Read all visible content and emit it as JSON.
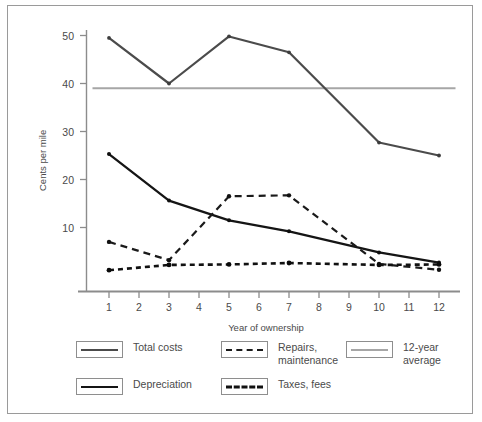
{
  "chart_data": {
    "type": "line",
    "title": "",
    "xlabel": "Year of ownership",
    "ylabel": "Cents per mile",
    "x": [
      1,
      2,
      3,
      4,
      5,
      6,
      7,
      8,
      9,
      10,
      11,
      12
    ],
    "xtick_labels": [
      "1",
      "2",
      "3",
      "4",
      "5",
      "6",
      "7",
      "8",
      "9",
      "10",
      "11",
      "12"
    ],
    "ytick_labels": [
      "10",
      "20",
      "30",
      "40",
      "50"
    ],
    "yticks": [
      10,
      20,
      30,
      40,
      50
    ],
    "xlim": [
      0.45,
      12.55
    ],
    "ylim": [
      0,
      53
    ],
    "grid": false,
    "legend_position": "below",
    "series": [
      {
        "name": "Total costs",
        "style": "solid",
        "color": "#4b4b4b",
        "x": [
          1,
          3,
          5,
          7,
          10,
          12
        ],
        "values": [
          49.5,
          40.0,
          49.8,
          46.5,
          27.7,
          25.0
        ]
      },
      {
        "name": "Depreciation",
        "style": "solid",
        "color": "#151515",
        "x": [
          1,
          3,
          5,
          7,
          10,
          12
        ],
        "values": [
          25.3,
          15.6,
          11.5,
          9.2,
          4.8,
          2.7
        ]
      },
      {
        "name": "Repairs, maintenance",
        "style": "dashed-long",
        "color": "#1a1a1a",
        "x": [
          1,
          3,
          5,
          7,
          10,
          12
        ],
        "values": [
          7.0,
          3.2,
          16.5,
          16.7,
          2.4,
          1.2
        ]
      },
      {
        "name": "Taxes, fees",
        "style": "dashed-short",
        "color": "#111111",
        "x": [
          1,
          3,
          5,
          7,
          10,
          12
        ],
        "values": [
          1.1,
          2.2,
          2.3,
          2.6,
          2.2,
          2.3
        ]
      },
      {
        "name": "12-year average",
        "style": "solid-reference",
        "color": "#a6a6a6",
        "x": [
          0.45,
          12.55
        ],
        "values": [
          39.0,
          39.0
        ]
      }
    ]
  },
  "axes": {
    "y_title": "Cents per mile",
    "x_title": "Year of ownership",
    "y_ticks": [
      "50",
      "40",
      "30",
      "20",
      "10"
    ],
    "x_ticks": [
      "1",
      "2",
      "3",
      "4",
      "5",
      "6",
      "7",
      "8",
      "9",
      "10",
      "11",
      "12"
    ]
  },
  "legend": {
    "entries": [
      {
        "label": "Total costs",
        "swatch": "solid-dark-line-swatch"
      },
      {
        "label": "Repairs,\nmaintenance",
        "swatch": "long-dashed-line-swatch"
      },
      {
        "label": "12-year average",
        "swatch": "solid-light-line-swatch"
      },
      {
        "label": "Depreciation",
        "swatch": "solid-black-line-swatch"
      },
      {
        "label": "Taxes, fees",
        "swatch": "short-dashed-line-swatch"
      }
    ]
  }
}
